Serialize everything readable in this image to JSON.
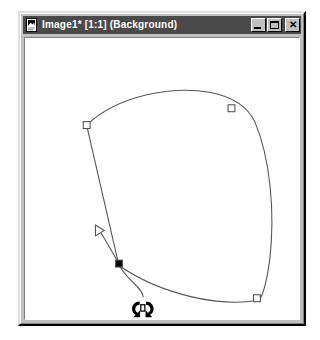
{
  "window": {
    "title": "Image1* [1:1] (Background)",
    "icon": "image-document-icon",
    "buttons": {
      "minimize_label": "_",
      "maximize_label": "",
      "close_label": "✕"
    }
  },
  "colors": {
    "titlebar_bg": "#4a4a4a",
    "titlebar_text": "#ffffff",
    "window_face": "#c0c0c0",
    "canvas_bg": "#ffffff",
    "path_stroke": "#555555",
    "handle_stroke": "#555555",
    "handle_fill": "#ffffff",
    "selected_handle_fill": "#000000",
    "tangent_line": "#555555"
  },
  "canvas": {
    "name": "image-canvas",
    "tool": "bezier-path-edit",
    "path": {
      "name": "bezier-closed-path",
      "d": "M 63 88 C 95 58 150 48 190 55 C 215 60 228 70 235 85 C 250 120 256 175 250 225 C 246 252 242 262 239 265 C 200 272 140 260 96 230",
      "closed": true
    },
    "control_points": [
      {
        "name": "anchor-top-left",
        "x": 63,
        "y": 88,
        "state": "unselected",
        "shape": "square-hollow"
      },
      {
        "name": "anchor-top-right",
        "x": 211,
        "y": 71,
        "state": "unselected",
        "shape": "square-hollow"
      },
      {
        "name": "anchor-bottom-right",
        "x": 237,
        "y": 263,
        "state": "unselected",
        "shape": "square-hollow"
      },
      {
        "name": "anchor-selected",
        "x": 96,
        "y": 228,
        "state": "selected",
        "shape": "square-filled"
      }
    ],
    "tangent_handle": {
      "name": "tangent-direction-handle",
      "from_x": 96,
      "from_y": 228,
      "to_x": 76,
      "to_y": 194,
      "marker": "triangle-hollow"
    },
    "cursor": {
      "name": "rotate-cursor",
      "x": 109,
      "y": 263,
      "glyph": "rotate-bidirectional"
    }
  }
}
